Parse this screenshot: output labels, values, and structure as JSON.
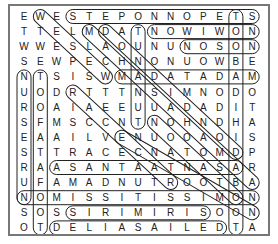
{
  "puzzle": {
    "rows": [
      "EWESTEPONNOPETS",
      "TTELMDATNOWIWON",
      "WWESLAOUNUNOSON",
      "SEWPECHNONUOWBE",
      "NTSISWMADATADAM",
      "UODRTTTNSIMNODO",
      "ROAIAEEUUADADIT",
      "SFMSCCNTNOHNDHA",
      "EAAILVENUOOAOIS",
      "STTRACECNATOMDP",
      "RAASANTAATNASAR",
      "UFAMADNUTROOTBA",
      "NOMISSITISSIMON",
      "SOSSIRIMIRISOON",
      "OTDELIASAILEDTA"
    ],
    "found_words": [
      {
        "word": "STEPONNOPETS",
        "r1": 0,
        "c1": 3,
        "r2": 0,
        "c2": 14
      },
      {
        "word": "NOWIWON",
        "r1": 1,
        "c1": 8,
        "r2": 1,
        "c2": 14
      },
      {
        "word": "NOSON",
        "r1": 2,
        "c1": 10,
        "r2": 2,
        "c2": 14
      },
      {
        "word": "MADATADAM",
        "r1": 4,
        "c1": 6,
        "r2": 4,
        "c2": 14
      },
      {
        "word": "ASANTAATNASA",
        "r1": 10,
        "c1": 2,
        "r2": 10,
        "c2": 13
      },
      {
        "word": "NOMISSITISSIMON",
        "r1": 12,
        "c1": 0,
        "r2": 12,
        "c2": 14
      },
      {
        "word": "SIRIMIRIS",
        "r1": 13,
        "c1": 3,
        "r2": 13,
        "c2": 11
      },
      {
        "word": "DELIASAILED",
        "r1": 14,
        "c1": 2,
        "r2": 14,
        "c2": 12
      },
      {
        "word": "NURSESRUN",
        "r1": 4,
        "c1": 0,
        "r2": 12,
        "c2": 0
      },
      {
        "word": "TOOFATAFOOT",
        "r1": 4,
        "c1": 1,
        "r2": 14,
        "c2": 1
      },
      {
        "word": "TUNANUT",
        "r1": 1,
        "c1": 7,
        "r2": 7,
        "c2": 7
      },
      {
        "word": "TONBADDIHIBDAABOOT",
        "r1": 0,
        "c1": 13,
        "r2": 14,
        "c2": 13
      },
      {
        "word": "WEEWEW",
        "r1": 0,
        "c1": 1,
        "r2": 4,
        "c2": 5
      },
      {
        "word": "MDIAGONAL",
        "r1": 1,
        "c1": 4,
        "r2": 11,
        "c2": 14
      },
      {
        "word": "DDIAGONAL",
        "r1": 1,
        "c1": 5,
        "r2": 9,
        "c2": 13
      },
      {
        "word": "RACECAR",
        "r1": 5,
        "c1": 3,
        "r2": 11,
        "c2": 9
      },
      {
        "word": "NOHNON",
        "r1": 7,
        "c1": 8,
        "r2": 12,
        "c2": 13
      },
      {
        "word": "TOMOT",
        "r1": 8,
        "c1": 6,
        "r2": 13,
        "c2": 14
      }
    ]
  }
}
